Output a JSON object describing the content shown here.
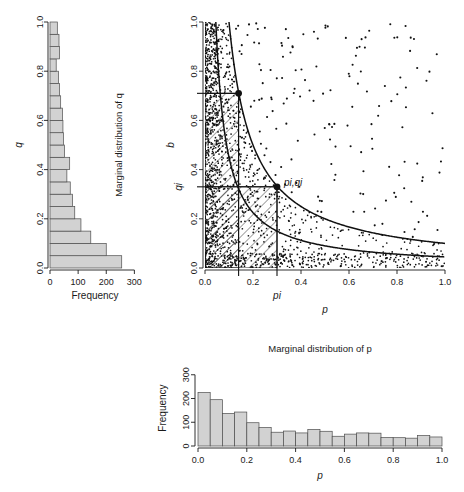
{
  "left_panel": {
    "title": "Marginal distribution of q",
    "xlabel": "Frequency",
    "ylabel": "q"
  },
  "scatter_panel": {
    "xlabel": "p",
    "ylabel": "b",
    "point_label": "pi,qi",
    "xmark_label": "pi",
    "ymark_label": "qi"
  },
  "bottom_panel": {
    "title": "Marginal distribution of p",
    "xlabel": "p",
    "ylabel": "Frequency"
  },
  "chart_data": [
    {
      "type": "bar",
      "name": "marginal-distribution-of-q",
      "orientation": "horizontal",
      "title": "Marginal distribution of q",
      "xlabel": "Frequency",
      "ylabel": "q",
      "xlim": [
        0,
        320
      ],
      "ylim": [
        0,
        1
      ],
      "xticks": [
        0,
        100,
        200,
        300
      ],
      "xtick_labels": [
        "0",
        "100",
        "200",
        "300"
      ],
      "yticks": [
        0.0,
        0.2,
        0.4,
        0.6,
        0.8,
        1.0
      ],
      "ytick_labels": [
        "0.0",
        "0.2",
        "0.4",
        "0.6",
        "0.8",
        "1.0"
      ],
      "bin_edges": [
        0.0,
        0.05,
        0.1,
        0.15,
        0.2,
        0.25,
        0.3,
        0.35,
        0.4,
        0.45,
        0.5,
        0.55,
        0.6,
        0.65,
        0.7,
        0.75,
        0.8,
        0.85,
        0.9,
        0.95,
        1.0
      ],
      "values": [
        255,
        200,
        145,
        110,
        88,
        80,
        72,
        60,
        70,
        52,
        48,
        46,
        44,
        38,
        34,
        30,
        22,
        34,
        32,
        26
      ],
      "grid": false,
      "legend": "none"
    },
    {
      "type": "scatter",
      "name": "p-vs-b-scatter",
      "xlabel": "p",
      "ylabel": "b",
      "xlim": [
        0,
        1
      ],
      "ylim": [
        0,
        1
      ],
      "xticks": [
        0.0,
        0.2,
        0.4,
        0.6,
        0.8,
        1.0
      ],
      "xtick_labels": [
        "0.0",
        "0.2",
        "0.4",
        "0.6",
        "0.8",
        "1.0"
      ],
      "yticks": [
        0.0,
        0.2,
        0.4,
        0.6,
        0.8,
        1.0
      ],
      "ytick_labels": [
        "0.0",
        "0.2",
        "0.4",
        "0.6",
        "0.8",
        "1.0"
      ],
      "n_points": 1400,
      "grid": false,
      "legend": "none",
      "annotations": [
        {
          "label": "pi,qi",
          "x": 0.3,
          "y": 0.33,
          "marker": "filled-circle"
        },
        {
          "label": "",
          "x": 0.14,
          "y": 0.71,
          "marker": "filled-circle"
        }
      ],
      "reference_curves": [
        {
          "name": "upper-hyperbola",
          "equation": "p*b = 0.100",
          "constant": 0.1
        },
        {
          "name": "lower-hyperbola",
          "equation": "p*b = 0.045",
          "constant": 0.045
        }
      ],
      "guide_lines": [
        {
          "orientation": "vertical",
          "value": 0.3
        },
        {
          "orientation": "vertical",
          "value": 0.14
        },
        {
          "orientation": "horizontal",
          "value": 0.33
        },
        {
          "orientation": "horizontal",
          "value": 0.71
        }
      ],
      "hatched_regions": [
        {
          "x_range": [
            0.0,
            0.3
          ],
          "y_range": [
            0.0,
            0.33
          ]
        },
        {
          "x_range": [
            0.0,
            0.14
          ],
          "y_range": [
            0.0,
            0.71
          ]
        }
      ]
    },
    {
      "type": "bar",
      "name": "marginal-distribution-of-p",
      "orientation": "vertical",
      "title": "Marginal distribution of p",
      "xlabel": "p",
      "ylabel": "Frequency",
      "xlim": [
        0,
        1
      ],
      "ylim": [
        0,
        320
      ],
      "xticks": [
        0.0,
        0.2,
        0.4,
        0.6,
        0.8,
        1.0
      ],
      "xtick_labels": [
        "0.0",
        "0.2",
        "0.4",
        "0.6",
        "0.8",
        "1.0"
      ],
      "yticks": [
        0,
        100,
        200,
        300
      ],
      "ytick_labels": [
        "0",
        "100",
        "200",
        "300"
      ],
      "bin_edges": [
        0.0,
        0.05,
        0.1,
        0.15,
        0.2,
        0.25,
        0.3,
        0.35,
        0.4,
        0.45,
        0.5,
        0.55,
        0.6,
        0.65,
        0.7,
        0.75,
        0.8,
        0.85,
        0.9,
        0.95,
        1.0
      ],
      "values": [
        225,
        195,
        137,
        143,
        98,
        78,
        58,
        63,
        55,
        70,
        62,
        41,
        50,
        55,
        54,
        36,
        35,
        33,
        44,
        38
      ],
      "grid": false,
      "legend": "none"
    }
  ]
}
